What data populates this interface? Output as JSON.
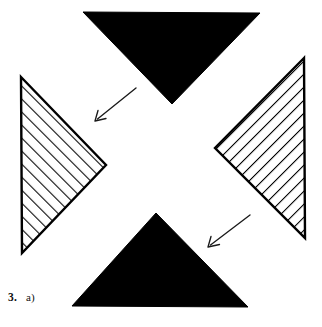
{
  "figure": {
    "caption": {
      "number": "3.",
      "part": "a)"
    },
    "colors": {
      "ink": "#000000",
      "paper": "#ffffff",
      "hatch_line": "#000000",
      "outline": "#000000"
    },
    "shapes": [
      {
        "name": "top-triangle",
        "fill": "solid-black",
        "direction": "points-down",
        "points": "83,12 260,13 172,104"
      },
      {
        "name": "bottom-triangle",
        "fill": "solid-black",
        "direction": "points-up",
        "points": "72,306 248,307 156,213"
      },
      {
        "name": "left-triangle",
        "fill": "diagonal-hatch",
        "direction": "points-right",
        "points": "21,77 106,165 22,253"
      },
      {
        "name": "right-triangle",
        "fill": "diagonal-hatch",
        "direction": "points-left",
        "points": "304,58 215,148 305,238"
      }
    ],
    "arrows": [
      {
        "name": "upper-left-arrow",
        "direction": "down-left",
        "from": "136,88",
        "to": "95,121"
      },
      {
        "name": "lower-right-arrow",
        "direction": "down-left",
        "from": "250,215",
        "to": "208,247"
      }
    ]
  }
}
